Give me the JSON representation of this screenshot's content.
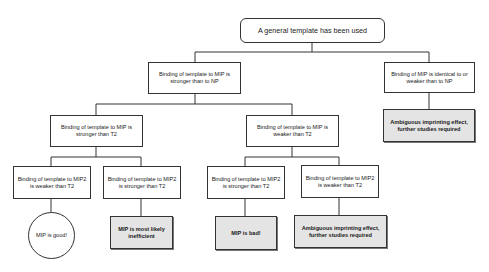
{
  "diagram": {
    "root": {
      "text": "A general template has been used"
    },
    "level1": [
      {
        "text": "Binding of template to MIP is stronger than to NP"
      },
      {
        "text": "Binding of MIP is identical to or weaker than to NP"
      }
    ],
    "level2": [
      {
        "text": "Binding of template to MIP is stronger than T2"
      },
      {
        "text": "Binding of template to MIP is weaker than T2"
      }
    ],
    "level3": [
      {
        "text": "Binding of template to MIP2 is weaker than T2"
      },
      {
        "text": "Binding of template to MIP2 is stronger than T2"
      },
      {
        "text": "Binding of template to MIP2 is stronger than T2"
      },
      {
        "text": "Binding of template to MIP2 is weaker than T2"
      }
    ],
    "outcomes": [
      {
        "text": "MIP is good!",
        "shape": "circle"
      },
      {
        "text": "MIP is most likely inefficient",
        "shape": "shaded-box"
      },
      {
        "text": "MIP is bad!",
        "shape": "shaded-box"
      },
      {
        "text": "Ambiguous imprinting effect, further studies required",
        "shape": "shaded-box"
      },
      {
        "text": "Ambiguous imprinting effect, further studies required",
        "shape": "shaded-box"
      }
    ]
  },
  "colors": {
    "line": "#333333",
    "outcome_fill": "#e4e4e4",
    "background": "#ffffff"
  }
}
